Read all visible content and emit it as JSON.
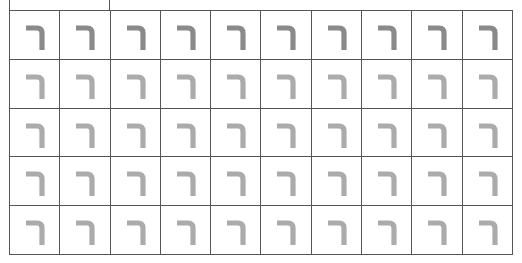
{
  "worksheet": {
    "letter": "ר",
    "letter_name": "resh",
    "rows": 5,
    "columns": 10,
    "colors": {
      "grid_line": "#555555",
      "glyph_row_1": "#8a8a8a",
      "glyph_other_rows": "#ababab",
      "background": "#ffffff"
    },
    "cells": [
      [
        "ר",
        "ר",
        "ר",
        "ר",
        "ר",
        "ר",
        "ר",
        "ר",
        "ר",
        "ר"
      ],
      [
        "ר",
        "ר",
        "ר",
        "ר",
        "ר",
        "ר",
        "ר",
        "ר",
        "ר",
        "ר"
      ],
      [
        "ר",
        "ר",
        "ר",
        "ר",
        "ר",
        "ר",
        "ר",
        "ר",
        "ר",
        "ר"
      ],
      [
        "ר",
        "ר",
        "ר",
        "ר",
        "ר",
        "ר",
        "ר",
        "ר",
        "ר",
        "ר"
      ],
      [
        "ר",
        "ר",
        "ر",
        "ר",
        "ר",
        "ר",
        "ר",
        "ר",
        "ר",
        "ר"
      ]
    ]
  }
}
